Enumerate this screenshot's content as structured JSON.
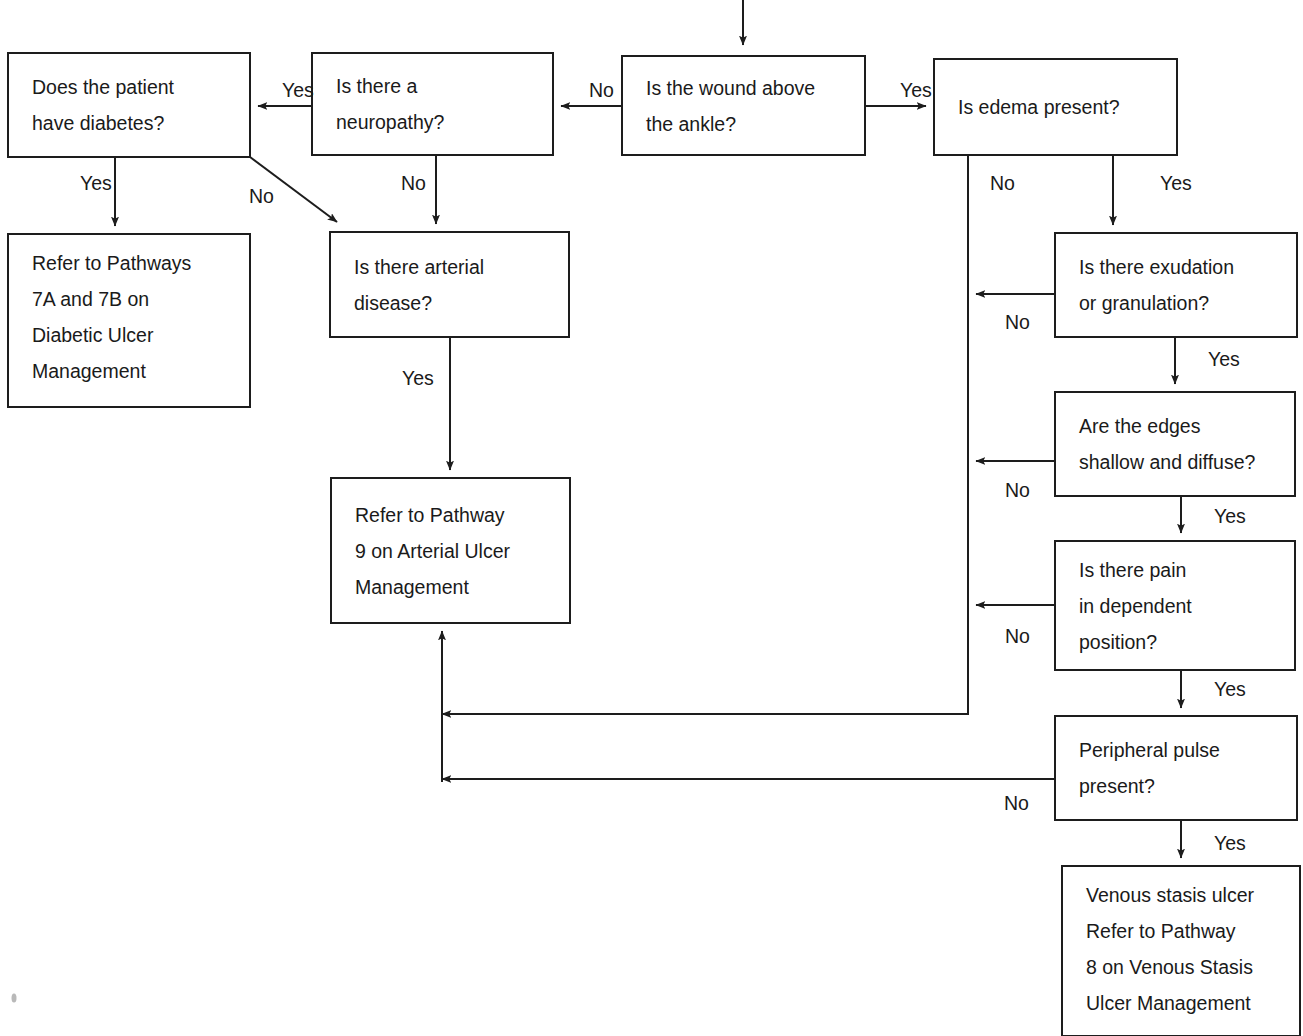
{
  "diagram": {
    "colors": {
      "line": "#1d1d1d",
      "text": "#1a1a1a",
      "background": "#ffffff"
    },
    "nodes": [
      {
        "id": "wound_above_ankle",
        "lines": [
          "Is the wound above",
          "the ankle?"
        ],
        "x": 622,
        "y": 56,
        "w": 243,
        "h": 99
      },
      {
        "id": "neuropathy",
        "lines": [
          "Is there a",
          "neuropathy?"
        ],
        "x": 312,
        "y": 53,
        "w": 241,
        "h": 102
      },
      {
        "id": "diabetes",
        "lines": [
          "Does the patient",
          "have diabetes?"
        ],
        "x": 8,
        "y": 53,
        "w": 242,
        "h": 104
      },
      {
        "id": "edema",
        "lines": [
          "Is edema present?"
        ],
        "x": 934,
        "y": 59,
        "w": 243,
        "h": 96
      },
      {
        "id": "refer_7a_7b",
        "lines": [
          "Refer to Pathways",
          "7A and 7B on",
          "Diabetic Ulcer",
          "Management"
        ],
        "x": 8,
        "y": 234,
        "w": 242,
        "h": 173
      },
      {
        "id": "arterial_disease",
        "lines": [
          "Is there arterial",
          "disease?"
        ],
        "x": 330,
        "y": 232,
        "w": 239,
        "h": 105
      },
      {
        "id": "refer_9",
        "lines": [
          "Refer to Pathway",
          "9 on Arterial Ulcer",
          "Management"
        ],
        "x": 331,
        "y": 478,
        "w": 239,
        "h": 145
      },
      {
        "id": "exudation",
        "lines": [
          "Is there exudation",
          "or granulation?"
        ],
        "x": 1055,
        "y": 233,
        "w": 242,
        "h": 104
      },
      {
        "id": "edges_shallow",
        "lines": [
          "Are the edges",
          "shallow and diffuse?"
        ],
        "x": 1055,
        "y": 392,
        "w": 240,
        "h": 104
      },
      {
        "id": "pain_dependent",
        "lines": [
          "Is there pain",
          "in dependent",
          "position?"
        ],
        "x": 1055,
        "y": 541,
        "w": 240,
        "h": 129
      },
      {
        "id": "peripheral_pulse",
        "lines": [
          "Peripheral pulse",
          "present?"
        ],
        "x": 1055,
        "y": 716,
        "w": 242,
        "h": 104
      },
      {
        "id": "venous_stasis",
        "lines": [
          "Venous stasis ulcer",
          "Refer to Pathway",
          "8 on Venous Stasis",
          "Ulcer Management"
        ],
        "x": 1062,
        "y": 866,
        "w": 238,
        "h": 170
      }
    ],
    "edge_labels": [
      {
        "id": "label-wound-no",
        "text": "No",
        "x": 589,
        "y": 97
      },
      {
        "id": "label-wound-yes",
        "text": "Yes",
        "x": 900,
        "y": 97
      },
      {
        "id": "label-neuropathy-yes",
        "text": "Yes",
        "x": 282,
        "y": 97
      },
      {
        "id": "label-neuropathy-no",
        "text": "No",
        "x": 401,
        "y": 190
      },
      {
        "id": "label-diabetes-yes",
        "text": "Yes",
        "x": 80,
        "y": 190
      },
      {
        "id": "label-diabetes-no",
        "text": "No",
        "x": 249,
        "y": 203
      },
      {
        "id": "label-arterial-yes",
        "text": "Yes",
        "x": 402,
        "y": 385
      },
      {
        "id": "label-edema-no",
        "text": "No",
        "x": 990,
        "y": 190
      },
      {
        "id": "label-edema-yes",
        "text": "Yes",
        "x": 1160,
        "y": 190
      },
      {
        "id": "label-exudation-no",
        "text": "No",
        "x": 1005,
        "y": 329
      },
      {
        "id": "label-exudation-yes",
        "text": "Yes",
        "x": 1208,
        "y": 366
      },
      {
        "id": "label-edges-no",
        "text": "No",
        "x": 1005,
        "y": 497
      },
      {
        "id": "label-edges-yes",
        "text": "Yes",
        "x": 1214,
        "y": 523
      },
      {
        "id": "label-pain-no",
        "text": "No",
        "x": 1005,
        "y": 643
      },
      {
        "id": "label-pain-yes",
        "text": "Yes",
        "x": 1214,
        "y": 696
      },
      {
        "id": "label-pulse-no",
        "text": "No",
        "x": 1004,
        "y": 810
      },
      {
        "id": "label-pulse-yes",
        "text": "Yes",
        "x": 1214,
        "y": 850
      }
    ],
    "connectors": [
      {
        "id": "conn-entry-to-wound",
        "path": "M 743 0 L 743 45"
      },
      {
        "id": "conn-wound-no-to-neuropathy",
        "path": "M 622 106 L 561 106"
      },
      {
        "id": "conn-neuropathy-yes-to-diabetes",
        "path": "M 312 106 L 258 106"
      },
      {
        "id": "conn-wound-yes-to-edema",
        "path": "M 865 106 L 926 106"
      },
      {
        "id": "conn-diabetes-yes-to-refer7",
        "path": "M 115 157 L 115 226"
      },
      {
        "id": "conn-diabetes-no-to-arterial",
        "path": "M 250 157 L 337 222"
      },
      {
        "id": "conn-neuropathy-no-to-arterial",
        "path": "M 436 155 L 436 224"
      },
      {
        "id": "conn-arterial-yes-to-refer9",
        "path": "M 450 337 L 450 470"
      },
      {
        "id": "conn-edema-no-down",
        "path": "M 968 155 L 968 714 L 442 714"
      },
      {
        "id": "conn-edema-yes-to-exudation",
        "path": "M 1113 155 L 1113 225"
      },
      {
        "id": "conn-exudation-no",
        "path": "M 1055 294 L 976 294"
      },
      {
        "id": "conn-exudation-yes-to-edges",
        "path": "M 1175 337 L 1175 384"
      },
      {
        "id": "conn-edges-no",
        "path": "M 1055 461 L 976 461"
      },
      {
        "id": "conn-edges-yes-to-pain",
        "path": "M 1181 496 L 1181 533"
      },
      {
        "id": "conn-pain-no",
        "path": "M 1055 605 L 976 605"
      },
      {
        "id": "conn-pain-yes-to-pulse",
        "path": "M 1181 670 L 1181 708"
      },
      {
        "id": "conn-pulse-no-left",
        "path": "M 1055 779 L 442 779"
      },
      {
        "id": "conn-pulse-yes-to-venous",
        "path": "M 1181 820 L 1181 858"
      },
      {
        "id": "conn-merge-up-to-refer9",
        "path": "M 442 782 L 442 631"
      }
    ]
  }
}
